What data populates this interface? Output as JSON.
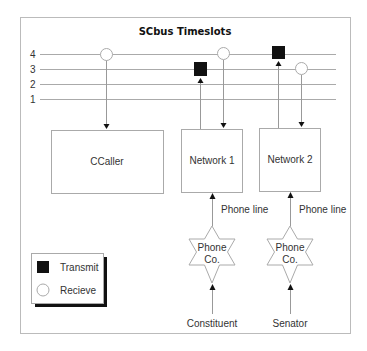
{
  "diagram": {
    "title": "SCbus Timeslots",
    "timeslots": [
      {
        "label": "4",
        "y": 54
      },
      {
        "label": "3",
        "y": 69
      },
      {
        "label": "2",
        "y": 84
      },
      {
        "label": "1",
        "y": 99
      }
    ],
    "boxes": [
      {
        "id": "ccaller",
        "label": "CCaller"
      },
      {
        "id": "network1",
        "label": "Network 1"
      },
      {
        "id": "network2",
        "label": "Network 2"
      }
    ],
    "phone_companies": [
      {
        "id": "phoneco1",
        "line1": "Phone",
        "line2": "Co."
      },
      {
        "id": "phoneco2",
        "line1": "Phone",
        "line2": "Co."
      }
    ],
    "phone_line_labels": [
      "Phone line",
      "Phone line"
    ],
    "endpoints": [
      "Constituent",
      "Senator"
    ],
    "legend": {
      "transmit": "Transmit",
      "receive": "Recieve"
    },
    "connections": [
      {
        "from": "timeslot-4",
        "to": "ccaller",
        "type": "receive"
      },
      {
        "from": "network1",
        "to": "timeslot-3",
        "type": "transmit"
      },
      {
        "from": "timeslot-4",
        "to": "network1",
        "type": "receive"
      },
      {
        "from": "network2",
        "to": "timeslot-4",
        "type": "transmit"
      },
      {
        "from": "timeslot-3",
        "to": "network2",
        "type": "receive"
      }
    ],
    "colors": {
      "line": "#aaaaaa",
      "frame": "#bbbbbb",
      "transmit": "#111111",
      "text": "#333333"
    }
  }
}
